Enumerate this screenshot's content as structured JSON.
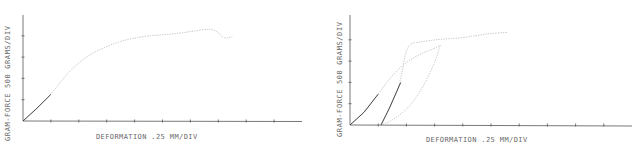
{
  "chart_data": [
    {
      "type": "line",
      "title": "",
      "xlabel": "DEFORMATION   .25 MM/DIV",
      "ylabel": "GRAM-FORCE   500 GRAMS/DIV",
      "x_unit_per_div": 0.25,
      "y_unit_per_div": 500,
      "xlim_div": [
        0,
        10
      ],
      "ylim_div": [
        0,
        5
      ],
      "grid": false,
      "series": [
        {
          "name": "loading",
          "x_div": [
            0,
            0.5,
            1.0,
            1.5,
            2.0,
            2.5,
            3.0,
            3.5,
            4.0,
            4.5,
            5.0,
            5.5,
            6.0,
            6.5,
            6.9,
            7.2,
            7.5
          ],
          "y_div": [
            0,
            0.6,
            1.25,
            2.1,
            2.75,
            3.2,
            3.5,
            3.75,
            3.9,
            4.0,
            4.05,
            4.1,
            4.2,
            4.3,
            4.3,
            3.85,
            3.95
          ]
        }
      ]
    },
    {
      "type": "line",
      "title": "",
      "xlabel": "DEFORMATION   .25 MM/DIV",
      "ylabel": "GRAM-FORCE   500 GRAMS/DIV",
      "x_unit_per_div": 0.25,
      "y_unit_per_div": 500,
      "xlim_div": [
        0,
        10
      ],
      "ylim_div": [
        0,
        5
      ],
      "grid": false,
      "series": [
        {
          "name": "first loading",
          "x_div": [
            0,
            0.5,
            1.0,
            1.5,
            2.0,
            2.5,
            3.0,
            3.2
          ],
          "y_div": [
            0,
            0.6,
            1.45,
            2.35,
            2.95,
            3.35,
            3.6,
            3.75
          ]
        },
        {
          "name": "unloading",
          "x_div": [
            3.2,
            3.0,
            2.6,
            2.2,
            1.8,
            1.4,
            1.1
          ],
          "y_div": [
            3.75,
            2.9,
            1.8,
            1.0,
            0.5,
            0.15,
            0
          ]
        },
        {
          "name": "reloading",
          "x_div": [
            1.1,
            1.4,
            1.8,
            2.0,
            2.5,
            3.0,
            3.5,
            4.0,
            4.5,
            5.0,
            5.6
          ],
          "y_div": [
            0,
            0.8,
            2.0,
            3.8,
            3.9,
            4.0,
            4.05,
            4.1,
            4.2,
            4.3,
            4.35
          ]
        }
      ]
    }
  ],
  "panels": [
    {
      "ylabel": "GRAM-FORCE   500 GRAMS/DIV",
      "xlabel": "DEFORMATION   .25 MM/DIV"
    },
    {
      "ylabel": "GRAM-FORCE   500 GRAMS/DIV",
      "xlabel": "DEFORMATION   .25 MM/DIV"
    }
  ],
  "colors": {
    "axis": "#555555",
    "trace_dark": "#333333",
    "trace_light": "#b8b8b8",
    "text": "#6a6a6a"
  }
}
